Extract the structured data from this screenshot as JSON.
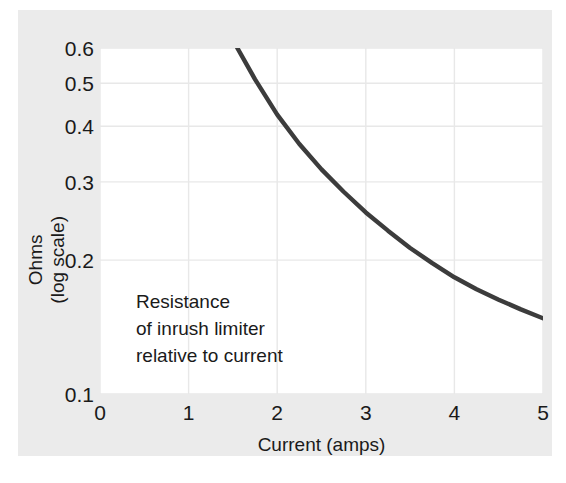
{
  "chart_data": {
    "type": "line",
    "title": "",
    "subtitle": "",
    "xlabel": "Current (amps)",
    "ylabel": "Ohms (log scale)",
    "ylabel_lines": [
      "Ohms",
      "(log scale)"
    ],
    "x_ticks": [
      "0",
      "1",
      "2",
      "3",
      "4",
      "5"
    ],
    "x_tick_values": [
      0,
      1,
      2,
      3,
      4,
      5
    ],
    "y_ticks": [
      "0.1",
      "0.2",
      "0.3",
      "0.4",
      "0.5",
      "0.6"
    ],
    "y_tick_values": [
      0.1,
      0.2,
      0.3,
      0.4,
      0.5,
      0.6
    ],
    "xlim": [
      0,
      5
    ],
    "ylim": [
      0.1,
      0.6
    ],
    "yscale": "log",
    "xscale": "linear",
    "grid": true,
    "legend": "none",
    "series": [
      {
        "name": "Resistance of inrush limiter",
        "x": [
          1.55,
          1.75,
          2.0,
          2.25,
          2.5,
          2.75,
          3.0,
          3.25,
          3.5,
          3.75,
          4.0,
          4.25,
          4.5,
          4.75,
          5.0
        ],
        "y": [
          0.6,
          0.51,
          0.425,
          0.365,
          0.32,
          0.285,
          0.256,
          0.233,
          0.213,
          0.197,
          0.183,
          0.172,
          0.163,
          0.155,
          0.148
        ]
      }
    ],
    "annotations": [
      {
        "lines": [
          "Resistance",
          "of inrush limiter",
          "relative to current"
        ],
        "x": 0.7,
        "y": 0.175
      }
    ],
    "colors": {
      "curve": "#3c3c3c",
      "grid": "#e8e8e8",
      "plot_background": "#ffffff",
      "panel_background": "#ebebeb",
      "text": "#1a1a1a"
    }
  },
  "axes": {
    "y_tick_labels": [
      "0.6",
      "0.5",
      "0.4",
      "0.3",
      "0.2",
      "0.1"
    ],
    "x_tick_labels": [
      "0",
      "1",
      "2",
      "3",
      "4",
      "5"
    ],
    "x_title": "Current (amps)",
    "y_title_line1": "Ohms",
    "y_title_line2": "(log scale)"
  },
  "annotation": {
    "line1": "Resistance",
    "line2": "of inrush limiter",
    "line3": "relative to current"
  }
}
